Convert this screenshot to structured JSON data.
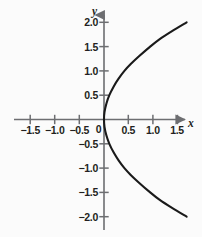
{
  "figure": {
    "background_color": "#fbfbfb",
    "ink_color": "#231f20",
    "curve_color": "#1a1a1a",
    "axis_color": "#6d6e71",
    "x_axis_name": "x",
    "y_axis_name": "y"
  },
  "chart_data": {
    "type": "line",
    "title": "",
    "xlabel": "x",
    "ylabel": "y",
    "xlim": [
      -1.85,
      1.75
    ],
    "ylim": [
      -2.25,
      2.25
    ],
    "grid": false,
    "legend": null,
    "x_ticks": [
      -1.5,
      -1.0,
      -0.5,
      0,
      0.5,
      1.0,
      1.5
    ],
    "x_tick_labels": [
      "−1.5",
      "−1.0",
      "−0.5",
      "0",
      "0.5",
      "1.0",
      "1.5"
    ],
    "y_ticks": [
      2.0,
      1.5,
      1.0,
      0.5,
      -0.5,
      -1.0,
      -1.5,
      -2.0
    ],
    "y_tick_labels": [
      "2.0",
      "1.5",
      "1.0",
      "0.5",
      "−0.5",
      "−1.0",
      "−1.5",
      "−2.0"
    ],
    "origin_label": "0",
    "series": [
      {
        "name": "parabola",
        "description": "rightward-opening parabola with vertex at the origin",
        "points": [
          {
            "x": 1.7,
            "y": 2.0
          },
          {
            "x": 1.4,
            "y": 1.82
          },
          {
            "x": 1.14,
            "y": 1.65
          },
          {
            "x": 0.95,
            "y": 1.5
          },
          {
            "x": 0.72,
            "y": 1.3
          },
          {
            "x": 0.55,
            "y": 1.14
          },
          {
            "x": 0.42,
            "y": 1.0
          },
          {
            "x": 0.3,
            "y": 0.84
          },
          {
            "x": 0.2,
            "y": 0.68
          },
          {
            "x": 0.11,
            "y": 0.5
          },
          {
            "x": 0.05,
            "y": 0.33
          },
          {
            "x": 0.01,
            "y": 0.15
          },
          {
            "x": 0.0,
            "y": 0.0
          },
          {
            "x": 0.01,
            "y": -0.15
          },
          {
            "x": 0.05,
            "y": -0.33
          },
          {
            "x": 0.11,
            "y": -0.5
          },
          {
            "x": 0.2,
            "y": -0.68
          },
          {
            "x": 0.3,
            "y": -0.84
          },
          {
            "x": 0.42,
            "y": -1.0
          },
          {
            "x": 0.55,
            "y": -1.14
          },
          {
            "x": 0.72,
            "y": -1.3
          },
          {
            "x": 0.95,
            "y": -1.5
          },
          {
            "x": 1.14,
            "y": -1.65
          },
          {
            "x": 1.4,
            "y": -1.82
          },
          {
            "x": 1.7,
            "y": -2.0
          }
        ]
      }
    ]
  },
  "geometry": {
    "origin_px": {
      "x": 104,
      "y": 119.5
    },
    "scale_px_per_unit": 48.6
  }
}
